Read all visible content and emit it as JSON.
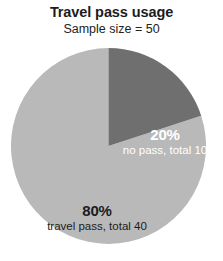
{
  "chart_data": {
    "type": "pie",
    "title": "Travel pass usage",
    "subtitle": "Sample size = 50",
    "xlabel": "",
    "ylabel": "",
    "legend_position": "none",
    "grid": false,
    "total": 50,
    "start_angle_deg": 0,
    "direction": "clockwise",
    "categories": [
      "travel pass",
      "no pass"
    ],
    "values": [
      40,
      10
    ],
    "percentages": [
      80,
      20
    ],
    "colors": [
      "#b9b9b9",
      "#6f6f6f"
    ],
    "slices": [
      {
        "name": "travel pass",
        "value": 40,
        "percent": 80,
        "percent_label": "80%",
        "description_label": "travel pass, total 40",
        "color": "#b9b9b9",
        "label_color": "#1c1c1c",
        "sweep_deg": 288
      },
      {
        "name": "no pass",
        "value": 10,
        "percent": 20,
        "percent_label": "20%",
        "description_label": "no pass, total 10",
        "color": "#6f6f6f",
        "label_color": "#ffffff",
        "sweep_deg": 72
      }
    ]
  },
  "header": {
    "title": "Travel pass usage",
    "subtitle": "Sample size = 50"
  },
  "labels": {
    "no_pass": {
      "percent": "20%",
      "description": "no pass, total 10"
    },
    "travel_pass": {
      "percent": "80%",
      "description": "travel pass, total 40"
    }
  }
}
